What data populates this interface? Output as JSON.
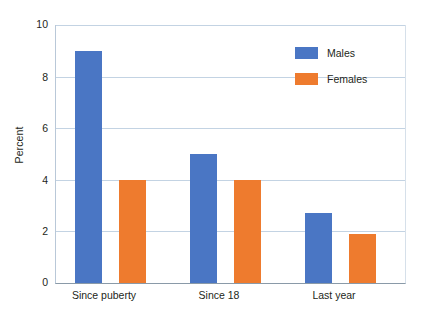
{
  "chart_data": {
    "type": "bar",
    "title": "",
    "xlabel": "",
    "ylabel": "Percent",
    "categories": [
      "Since puberty",
      "Since 18",
      "Last year"
    ],
    "series": [
      {
        "name": "Males",
        "color": "#4a76c4",
        "values": [
          9.0,
          5.0,
          2.7
        ]
      },
      {
        "name": "Females",
        "color": "#ee7b2e",
        "values": [
          4.0,
          4.0,
          1.9
        ]
      }
    ],
    "ylim": [
      0,
      10
    ],
    "yticks": [
      "0",
      "2",
      "4",
      "6",
      "8",
      "10"
    ],
    "ytick_values": [
      0,
      2,
      4,
      6,
      8,
      10
    ],
    "grid": "horizontal",
    "legend_position": "top-right",
    "gridline_color": "#c3d3e3",
    "axis_color": "#8a9aa8",
    "background": "#ffffff"
  },
  "legend": {
    "entries": [
      {
        "label": "Males",
        "color": "#4a76c4"
      },
      {
        "label": "Females",
        "color": "#ee7b2e"
      }
    ]
  }
}
